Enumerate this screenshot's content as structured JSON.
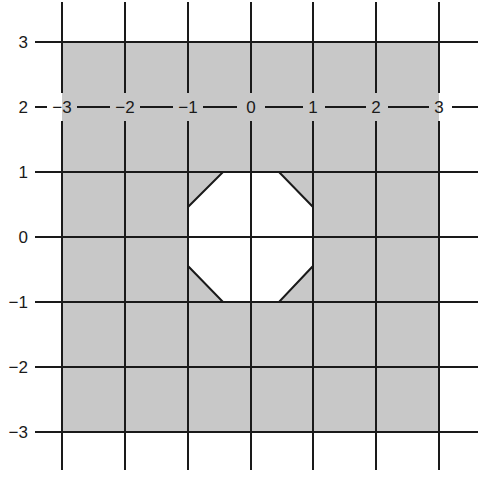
{
  "diagram": {
    "type": "coordinate-grid-region",
    "x_tick_labels": [
      "−3",
      "−2",
      "−1",
      "0",
      "1",
      "2",
      "3"
    ],
    "y_tick_labels": [
      "3",
      "2",
      "1",
      "0",
      "−1",
      "−2",
      "−3"
    ],
    "x_labels_row_value": "2",
    "x_range": [
      -3,
      3
    ],
    "y_range": [
      -3,
      3
    ],
    "shaded_region": {
      "x": [
        -3,
        3
      ],
      "y": [
        -3,
        3
      ]
    },
    "octagon_hole_vertices": [
      [
        -0.45,
        1
      ],
      [
        0.45,
        1
      ],
      [
        1,
        0.45
      ],
      [
        1,
        -0.45
      ],
      [
        0.45,
        -1
      ],
      [
        -0.45,
        -1
      ],
      [
        -1,
        -0.45
      ],
      [
        -1,
        0.45
      ]
    ],
    "colors": {
      "shade": "#c8c8c8",
      "hole": "#ffffff",
      "gridline": "#1a1a1a",
      "background": "#ffffff"
    }
  }
}
